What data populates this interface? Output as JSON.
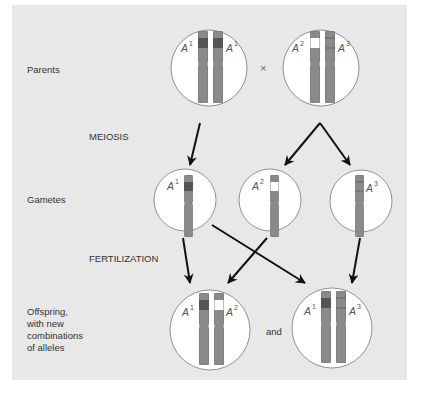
{
  "diagram": {
    "row_labels": {
      "parents": "Parents",
      "meiosis": "MEIOSIS",
      "gametes": "Gametes",
      "fertilization": "FERTILIZATION",
      "offspring_line1": "Offspring,",
      "offspring_line2": "with new",
      "offspring_line3": "combinations",
      "offspring_line4": "of alleles"
    },
    "cross_symbol": "×",
    "and_label": "and",
    "allele_letter": "A",
    "parents": [
      {
        "alleles": [
          "1",
          "1"
        ]
      },
      {
        "alleles": [
          "2",
          "3"
        ]
      }
    ],
    "gametes": [
      {
        "allele": "1"
      },
      {
        "allele": "2"
      },
      {
        "allele": "3"
      }
    ],
    "offspring": [
      {
        "alleles": [
          "1",
          "2"
        ]
      },
      {
        "alleles": [
          "1",
          "3"
        ]
      }
    ],
    "colors": {
      "background": "#e8e8e8",
      "circle_fill": "#ffffff",
      "chromosome": "#8a8a8a",
      "allele_A1_band": "#555555",
      "allele_A2_band": "#ffffff",
      "allele_A3_band": "#8a8a8a",
      "arrow": "#111111"
    }
  }
}
